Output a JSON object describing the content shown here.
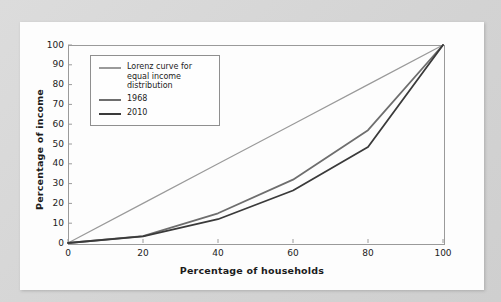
{
  "chart_data": {
    "type": "line",
    "title": "",
    "xlabel": "Percentage of households",
    "ylabel": "Percentage of income",
    "xlim": [
      0,
      100
    ],
    "ylim": [
      0,
      100
    ],
    "xticks": [
      0,
      20,
      40,
      60,
      80,
      100
    ],
    "yticks": [
      0,
      10,
      20,
      30,
      40,
      50,
      60,
      70,
      80,
      90,
      100
    ],
    "grid": false,
    "legend_position": "upper-left-inside",
    "x": [
      0,
      20,
      40,
      60,
      80,
      100
    ],
    "series": [
      {
        "name": "Lorenz curve for equal income distribution",
        "color": "#9a9a9a",
        "width": 1.2,
        "values": [
          0,
          20,
          40,
          60,
          80,
          100
        ]
      },
      {
        "name": "1968",
        "color": "#6e6e6e",
        "width": 1.8,
        "values": [
          0,
          3.5,
          15,
          32,
          57,
          100
        ]
      },
      {
        "name": "2010",
        "color": "#3a3a3a",
        "width": 1.8,
        "values": [
          0,
          3.3,
          12,
          26.5,
          48.5,
          100
        ]
      }
    ]
  },
  "legend": {
    "entries": [
      {
        "label": "Lorenz curve for equal income distribution"
      },
      {
        "label": "1968"
      },
      {
        "label": "2010"
      }
    ]
  },
  "axes": {
    "x_tick_labels": [
      "0",
      "20",
      "40",
      "60",
      "80",
      "100"
    ],
    "y_tick_labels": [
      "0",
      "10",
      "20",
      "30",
      "40",
      "50",
      "60",
      "70",
      "80",
      "90",
      "100"
    ]
  }
}
